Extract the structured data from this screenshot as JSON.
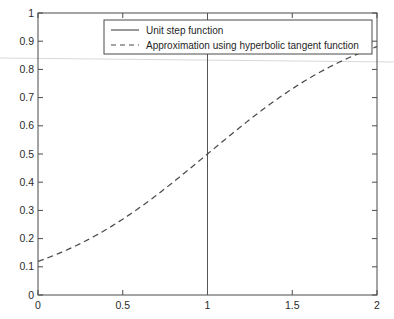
{
  "chart_data": {
    "type": "line",
    "title": "",
    "xlabel": "",
    "ylabel": "",
    "xlim": [
      0,
      2
    ],
    "ylim": [
      0,
      1
    ],
    "grid": false,
    "legend_position": "top-center",
    "xticks": [
      "0",
      "0.5",
      "1",
      "1.5",
      "2"
    ],
    "xtick_values": [
      0,
      0.5,
      1,
      1.5,
      2
    ],
    "yticks": [
      "0",
      "0.1",
      "0.2",
      "0.3",
      "0.4",
      "0.5",
      "0.6",
      "0.7",
      "0.8",
      "0.9",
      "1"
    ],
    "ytick_values": [
      0,
      0.1,
      0.2,
      0.3,
      0.4,
      0.5,
      0.6,
      0.7,
      0.8,
      0.9,
      1
    ],
    "series": [
      {
        "name": "Unit step function",
        "style": "solid",
        "color": "#555555",
        "x": [
          1,
          1
        ],
        "values": [
          0,
          1
        ]
      },
      {
        "name": "Approximation using hyperbolic tangent function",
        "style": "dashed",
        "color": "#4b4b4b",
        "x": [
          0,
          0.1,
          0.2,
          0.3,
          0.4,
          0.5,
          0.6,
          0.7,
          0.8,
          0.9,
          1,
          1.1,
          1.2,
          1.3,
          1.4,
          1.5,
          1.6,
          1.7,
          1.8,
          1.9,
          2
        ],
        "values": [
          0.119,
          0.136,
          0.155,
          0.177,
          0.2,
          0.227,
          0.256,
          0.288,
          0.323,
          0.36,
          0.5,
          0.44,
          0.482,
          0.525,
          0.567,
          0.608,
          0.648,
          0.685,
          0.72,
          0.752,
          0.881
        ]
      }
    ]
  },
  "legend": {
    "entries": [
      {
        "label": "Unit step function",
        "style": "solid"
      },
      {
        "label": "Approximation using hyperbolic tangent function",
        "style": "dashed"
      }
    ]
  },
  "axes": {
    "x_tick_labels": [
      "0",
      "0.5",
      "1",
      "1.5",
      "2"
    ],
    "y_tick_labels": [
      "0",
      "0.1",
      "0.2",
      "0.3",
      "0.4",
      "0.5",
      "0.6",
      "0.7",
      "0.8",
      "0.9",
      "1"
    ]
  },
  "colors": {
    "background": "#ffffff",
    "axis": "#4a4a4a",
    "step_line": "#555555",
    "approx_line": "#4b4b4b",
    "text": "#2b2b2b",
    "artifact": "#d8d8d8"
  }
}
